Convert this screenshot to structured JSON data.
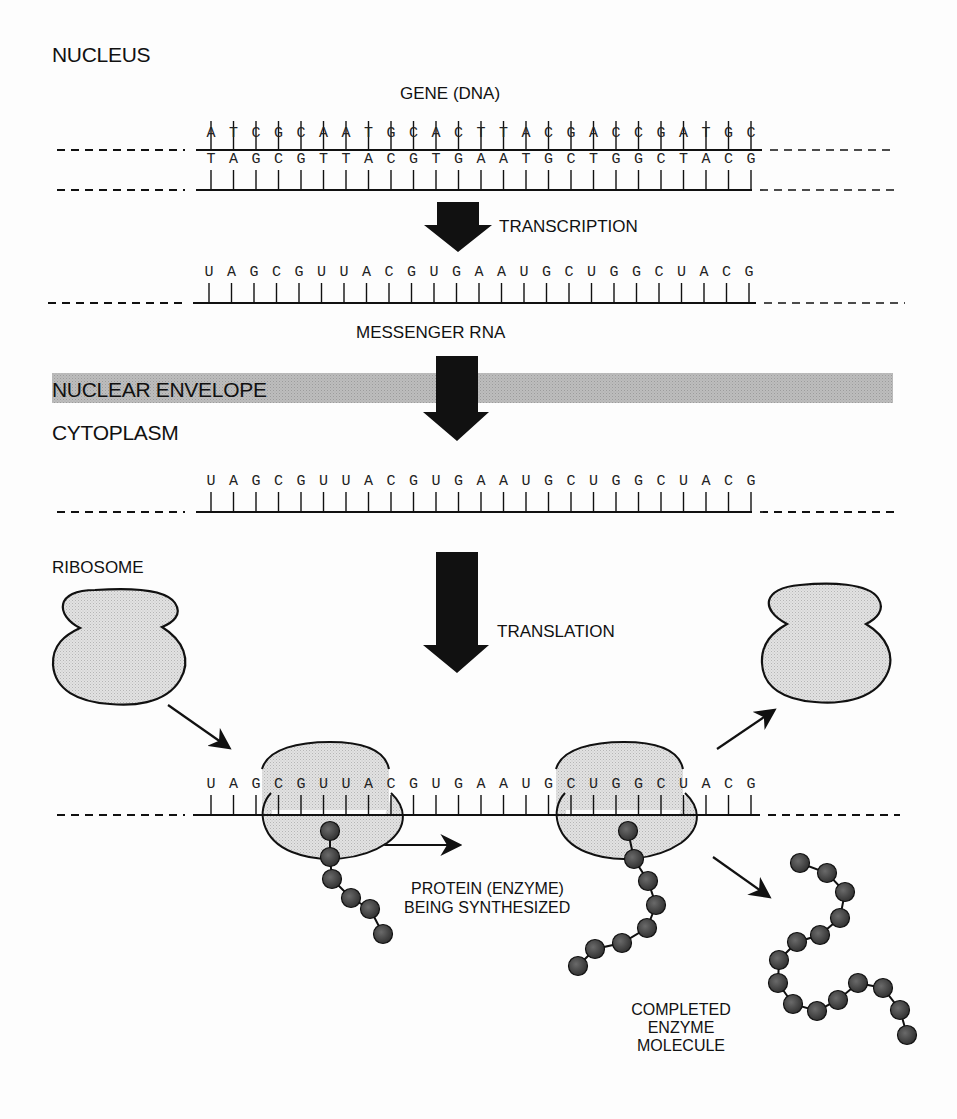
{
  "labels": {
    "nucleus": "NUCLEUS",
    "gene": "GENE (DNA)",
    "transcription": "TRANSCRIPTION",
    "messenger_rna": "MESSENGER RNA",
    "nuclear_envelope": "NUCLEAR ENVELOPE",
    "cytoplasm": "CYTOPLASM",
    "ribosome": "RIBOSOME",
    "translation": "TRANSLATION",
    "protein_line1": "PROTEIN (ENZYME)",
    "protein_line2": "BEING SYNTHESIZED",
    "completed_line1": "COMPLETED",
    "completed_line2": "ENZYME",
    "completed_line3": "MOLECULE"
  },
  "sequences": {
    "dna_top": [
      "A",
      "T",
      "C",
      "G",
      "C",
      "A",
      "A",
      "T",
      "G",
      "C",
      "A",
      "C",
      "T",
      "T",
      "A",
      "C",
      "G",
      "A",
      "C",
      "C",
      "G",
      "A",
      "T",
      "G",
      "C"
    ],
    "dna_bottom": [
      "T",
      "A",
      "G",
      "C",
      "G",
      "T",
      "T",
      "A",
      "C",
      "G",
      "T",
      "G",
      "A",
      "A",
      "T",
      "G",
      "C",
      "T",
      "G",
      "G",
      "C",
      "T",
      "A",
      "C",
      "G"
    ],
    "mrna": [
      "U",
      "A",
      "G",
      "C",
      "G",
      "U",
      "U",
      "A",
      "C",
      "G",
      "U",
      "G",
      "A",
      "A",
      "U",
      "G",
      "C",
      "U",
      "G",
      "G",
      "C",
      "U",
      "A",
      "C",
      "G"
    ]
  },
  "colors": {
    "ink": "#111111",
    "envelope_band": "#b8b8b8",
    "ribosome_fill": "#dcdcdc",
    "bead_fill": "#4a4a4a"
  }
}
